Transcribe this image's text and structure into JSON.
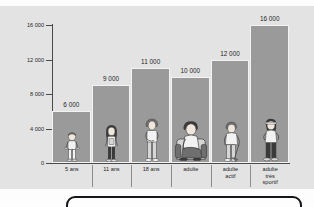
{
  "figure": {
    "background_color": "#e3e3e3",
    "bar_color": "#9a9a9a",
    "axis_color": "#4a4a4a"
  },
  "chart_data": {
    "type": "bar",
    "title": "",
    "subtitle": "",
    "xlabel": "",
    "ylabel": "",
    "categories": [
      "5 ans",
      "11 ans",
      "18 ans",
      "adulte",
      "adulte\nactif",
      "adulte\ntrès\nsportif"
    ],
    "values": [
      6000,
      9000,
      11000,
      10000,
      12000,
      16000
    ],
    "value_labels": [
      "6 000",
      "9 000",
      "11 000",
      "10 000",
      "12 000",
      "16 000"
    ],
    "ylim": [
      0,
      16000
    ],
    "yticks": [
      0,
      4000,
      8000,
      12000,
      16000
    ],
    "ytick_labels": [
      "0",
      "4 000",
      "8 000",
      "12 000",
      "16 000"
    ],
    "grid": false,
    "legend": null,
    "bar_illustrations": [
      "child-standing",
      "girl-standing",
      "teenager-standing",
      "adult-seated-armchair",
      "adult-gardening",
      "adult-running"
    ]
  },
  "bottom_panel": {
    "label": ""
  }
}
